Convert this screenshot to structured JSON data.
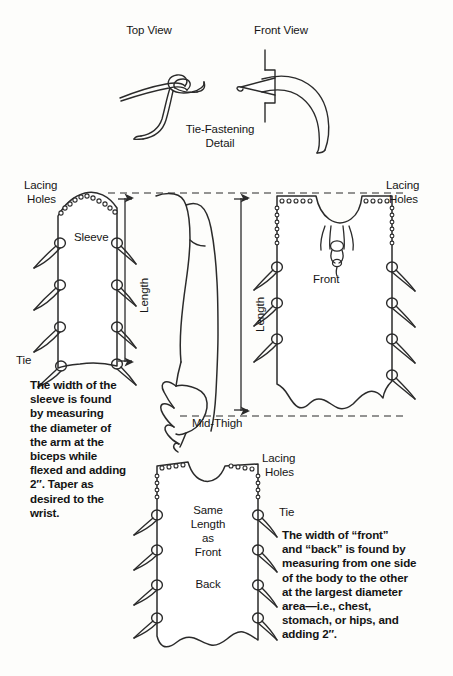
{
  "diagram": {
    "detail_section": {
      "top_view_label": "Top View",
      "front_view_label": "Front View",
      "caption_line1": "Tie-Fastening",
      "caption_line2": "Detail"
    },
    "sleeve_panel": {
      "piece_label": "Sleeve",
      "lacing_holes_label_line1": "Lacing",
      "lacing_holes_label_line2": "Holes",
      "tie_label": "Tie",
      "length_label": "Length"
    },
    "front_panel": {
      "piece_label": "Front",
      "lacing_holes_label_line1": "Lacing",
      "lacing_holes_label_line2": "Holes",
      "length_label": "Length",
      "mid_thigh_label": "Mid-Thigh"
    },
    "back_panel": {
      "piece_label": "Back",
      "same_length_line1": "Same",
      "same_length_line2": "Length",
      "same_length_line3": "as",
      "same_length_line4": "Front",
      "lacing_holes_label_line1": "Lacing",
      "lacing_holes_label_line2": "Holes",
      "tie_label": "Tie"
    },
    "notes": {
      "sleeve_note": "The width of the\nsleeve is found\nby measuring\nthe diameter of\nthe arm at the\nbiceps while\nflexed and adding\n2″. Taper as\ndesired to the\nwrist.",
      "body_note": "The width of “front”\nand “back” is found by\nmeasuring from one side\nof the body to the other\nat the largest diameter\narea—i.e., chest,\nstomach, or hips, and\nadding 2″."
    },
    "colors": {
      "ink": "#1a1a1a",
      "paper": "#fdfdfb",
      "line": "#2b2b2b"
    }
  }
}
